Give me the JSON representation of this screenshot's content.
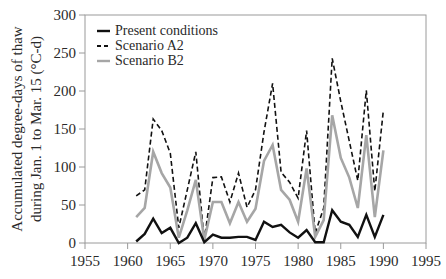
{
  "chart_data": {
    "type": "line",
    "title": "",
    "xlabel": "",
    "ylabel": "Accumulated degree-days of thaw during Jan. 1 to Mar. 15 (°C-d)",
    "ylabel_lines": [
      "Accumulated degree-days of thaw",
      "during Jan. 1 to Mar. 15 (°C-d)"
    ],
    "xlim": [
      1955,
      1995
    ],
    "ylim": [
      0,
      300
    ],
    "xticks": [
      1955,
      1960,
      1965,
      1970,
      1975,
      1980,
      1985,
      1990,
      1995
    ],
    "yticks": [
      0,
      50,
      100,
      150,
      200,
      250,
      300
    ],
    "grid": false,
    "legend_position": "upper-left",
    "x": [
      1961,
      1962,
      1963,
      1964,
      1965,
      1966,
      1967,
      1968,
      1969,
      1970,
      1971,
      1972,
      1973,
      1974,
      1975,
      1976,
      1977,
      1978,
      1979,
      1980,
      1981,
      1982,
      1983,
      1984,
      1985,
      1986,
      1987,
      1988,
      1989,
      1990
    ],
    "series": [
      {
        "name": "Present conditions",
        "style": "solid",
        "color": "#111111",
        "values": [
          2,
          12,
          32,
          13,
          20,
          0,
          7,
          26,
          1,
          11,
          7,
          7,
          8,
          8,
          4,
          28,
          21,
          24,
          14,
          7,
          17,
          1,
          1,
          43,
          28,
          24,
          8,
          37,
          8,
          37
        ]
      },
      {
        "name": "Scenario A2",
        "style": "dashed",
        "color": "#111111",
        "values": [
          62,
          70,
          163,
          148,
          118,
          20,
          70,
          120,
          4,
          86,
          87,
          54,
          92,
          47,
          70,
          146,
          210,
          93,
          80,
          59,
          148,
          13,
          46,
          243,
          186,
          134,
          82,
          201,
          68,
          175
        ]
      },
      {
        "name": "Scenario B2",
        "style": "solid",
        "color": "#a6a6a6",
        "values": [
          34,
          46,
          120,
          92,
          73,
          7,
          43,
          83,
          4,
          54,
          54,
          26,
          54,
          28,
          45,
          108,
          129,
          70,
          57,
          28,
          98,
          8,
          30,
          168,
          112,
          86,
          46,
          142,
          34,
          122
        ]
      }
    ]
  },
  "legend": {
    "items": [
      {
        "label": "Present conditions"
      },
      {
        "label": "Scenario A2"
      },
      {
        "label": "Scenario B2"
      }
    ]
  },
  "axes": {
    "ylabel_line1": "Accumulated degree-days of thaw",
    "ylabel_line2": "during Jan. 1 to Mar. 15 (°C-d)",
    "xtick_labels": [
      "1955",
      "1960",
      "1965",
      "1970",
      "1975",
      "1980",
      "1985",
      "1990",
      "1995"
    ],
    "ytick_labels": [
      "0",
      "50",
      "100",
      "150",
      "200",
      "250",
      "300"
    ]
  }
}
